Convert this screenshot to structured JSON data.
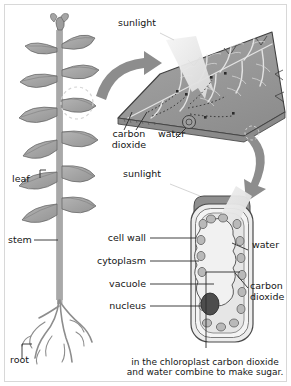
{
  "figure": {
    "background": "#ffffff",
    "frame_color": "#d8d8d8"
  },
  "colors": {
    "leaf_fill": "#9b9b9b",
    "leaf_vein": "#e2e2e2",
    "leaf_edge": "#4a4a4a",
    "plant_fill": "#a8a8a8",
    "plant_edge": "#5a5a5a",
    "arrow": "#8d8d8d",
    "cell_cap": "#8f8f8f",
    "cell_wall": "#bdbdbd",
    "cytoplasm": "#e9e9e9",
    "vacuole": "#efefef",
    "chloroplast": "#b5b5b5",
    "nucleus": "#4d4d4d",
    "sunbeam": "#efefef",
    "leader": "#2a2a2a",
    "text": "#161616"
  },
  "labels": {
    "sunlight_leaf": "sunlight",
    "sunlight_cell": "sunlight",
    "carbon_dioxide_leaf": "carbon\ndioxide",
    "water_leaf": "water",
    "leaf": "leaf",
    "stem": "stem",
    "root": "root",
    "cell_wall": "cell wall",
    "cytoplasm": "cytoplasm",
    "vacuole": "vacuole",
    "nucleus": "nucleus",
    "water_cell": "water",
    "carbon_dioxide_cell": "carbon\ndioxide"
  },
  "caption": {
    "text": "in the chloroplast carbon dioxide\nand water combine to make sugar."
  },
  "panels": {
    "plant": {
      "name": "whole-plant",
      "parts": [
        "leaf",
        "stem",
        "root"
      ]
    },
    "leaf": {
      "name": "leaf-closeup",
      "inputs": [
        "sunlight",
        "carbon dioxide",
        "water"
      ]
    },
    "cell": {
      "name": "plant-cell-closeup",
      "parts": [
        "cell wall",
        "cytoplasm",
        "vacuole",
        "nucleus"
      ],
      "inputs": [
        "sunlight",
        "water",
        "carbon dioxide"
      ]
    }
  }
}
